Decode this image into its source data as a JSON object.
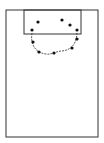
{
  "diagram": {
    "type": "basketball-half-court",
    "colors": {
      "background": "#ffffff",
      "line": "#333333",
      "dot": "#111111"
    },
    "court": {
      "x": 6,
      "y": 10,
      "width": 92,
      "height": 127
    },
    "key": {
      "x": 24,
      "y": 10,
      "width": 57,
      "height": 24
    },
    "arc_path": "M32,33 C30,45 36,53 46,54 C52,55 56,51 62,51 C70,50 76,46 77,33",
    "players": [
      {
        "x": 38,
        "y": 22
      },
      {
        "x": 62,
        "y": 20
      },
      {
        "x": 70,
        "y": 25
      },
      {
        "x": 32,
        "y": 30
      },
      {
        "x": 77,
        "y": 30
      },
      {
        "x": 33,
        "y": 42
      },
      {
        "x": 39,
        "y": 52
      },
      {
        "x": 54,
        "y": 53
      },
      {
        "x": 72,
        "y": 48
      },
      {
        "x": 77,
        "y": 39
      }
    ]
  }
}
